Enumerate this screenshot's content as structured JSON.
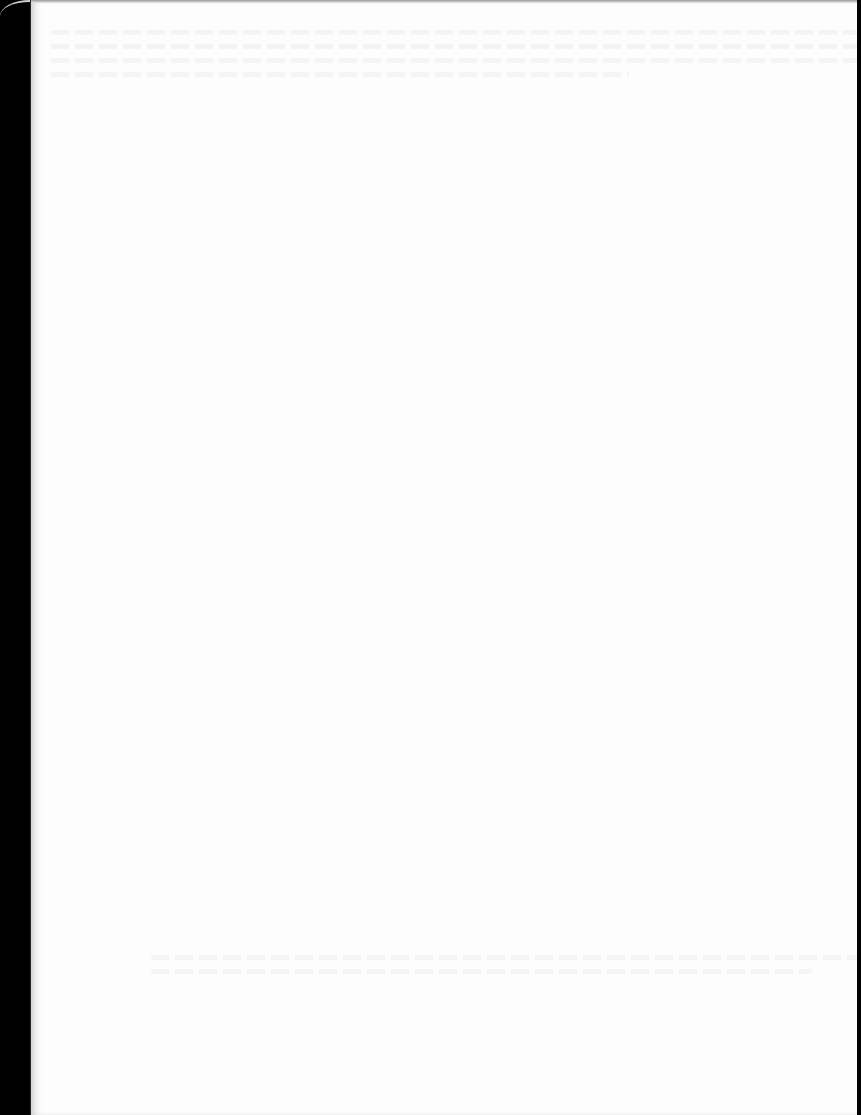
{
  "document": {
    "type": "scanned-page",
    "visible_text": "",
    "note": "Blank page; faint illegible show-through only"
  },
  "colors": {
    "page_background": "#fdfdfd",
    "scanner_bed": "#000000"
  }
}
